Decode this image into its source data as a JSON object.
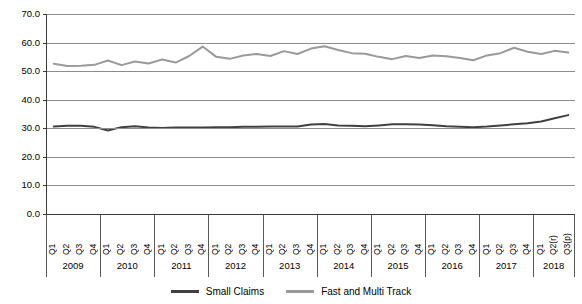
{
  "chart_data": {
    "type": "line",
    "title": "",
    "xlabel": "",
    "ylabel": "",
    "ylim": [
      0,
      70
    ],
    "ytick_step": 10,
    "ytick_labels": [
      "70.0",
      "60.0",
      "50.0",
      "40.0",
      "30.0",
      "20.0",
      "10.0",
      "0.0"
    ],
    "ytick_values": [
      70,
      60,
      50,
      40,
      30,
      20,
      10,
      0
    ],
    "grid": true,
    "legend_position": "bottom-center",
    "years": [
      "2009",
      "2010",
      "2011",
      "2012",
      "2013",
      "2014",
      "2015",
      "2016",
      "2017",
      "2018"
    ],
    "quarters_per_year": [
      4,
      4,
      4,
      4,
      4,
      4,
      4,
      4,
      4,
      3
    ],
    "categories": [
      "Q1",
      "Q2",
      "Q3",
      "Q4",
      "Q1",
      "Q2",
      "Q3",
      "Q4",
      "Q1",
      "Q2",
      "Q3",
      "Q4",
      "Q1",
      "Q2",
      "Q3",
      "Q4",
      "Q1",
      "Q2",
      "Q3",
      "Q4",
      "Q1",
      "Q2",
      "Q3",
      "Q4",
      "Q1",
      "Q2",
      "Q3",
      "Q4",
      "Q1",
      "Q2",
      "Q3",
      "Q4",
      "Q1",
      "Q2",
      "Q3",
      "Q4",
      "Q1",
      "Q2(r)",
      "Q3(p)"
    ],
    "series": [
      {
        "name": "Small Claims",
        "color": "#404040",
        "values": [
          30.6,
          30.9,
          30.9,
          30.5,
          29.2,
          30.4,
          30.7,
          30.3,
          30.1,
          30.3,
          30.3,
          30.3,
          30.4,
          30.4,
          30.5,
          30.5,
          30.6,
          30.6,
          30.6,
          31.3,
          31.5,
          31.0,
          30.9,
          30.7,
          31.0,
          31.4,
          31.4,
          31.3,
          31.1,
          30.7,
          30.5,
          30.4,
          30.6,
          31.0,
          31.4,
          31.8,
          32.4,
          33.5,
          34.6
        ]
      },
      {
        "name": "Fast and Multi Track",
        "color": "#9a9a9a",
        "values": [
          52.6,
          51.8,
          51.9,
          52.2,
          53.7,
          52.1,
          53.4,
          52.7,
          54.1,
          53.0,
          55.3,
          58.6,
          55.0,
          54.3,
          55.5,
          56.0,
          55.3,
          57.0,
          56.0,
          57.9,
          58.7,
          57.4,
          56.3,
          56.1,
          55.0,
          54.2,
          55.3,
          54.6,
          55.5,
          55.2,
          54.6,
          53.8,
          55.5,
          56.3,
          58.2,
          56.8,
          56.0,
          57.1,
          56.5
        ]
      }
    ]
  },
  "legend": {
    "items": [
      {
        "label": "Small Claims",
        "color": "#404040"
      },
      {
        "label": "Fast and Multi Track",
        "color": "#9a9a9a"
      }
    ]
  }
}
